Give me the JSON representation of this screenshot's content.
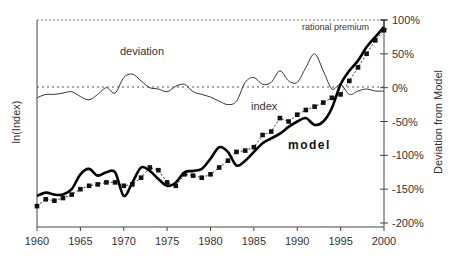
{
  "chart_data": {
    "type": "line",
    "title": "",
    "xlabel": "",
    "ylabel_left": "ln(Index)",
    "ylabel_right": "Deviation from Model",
    "xlim": [
      1960,
      2000
    ],
    "x_ticks": [
      "1960",
      "1965",
      "1970",
      "1975",
      "1980",
      "1985",
      "1990",
      "1995",
      "2000"
    ],
    "right_axis_ticks": [
      "100%",
      "50%",
      "0%",
      "-50%",
      "-100%",
      "-150%",
      "-200%"
    ],
    "right_axis_range": [
      -200,
      100
    ],
    "grid": false,
    "zero_line": "dotted",
    "top_line": "dotted",
    "annotations": {
      "deviation": "deviation",
      "index": "index",
      "model": "model",
      "rational_premium": "rational premium"
    },
    "series": [
      {
        "name": "deviation",
        "style": "thin solid line",
        "axis": "right",
        "x": [
          1960,
          1961,
          1962,
          1963,
          1964,
          1965,
          1966,
          1967,
          1968,
          1969,
          1970,
          1971,
          1972,
          1973,
          1974,
          1975,
          1976,
          1977,
          1978,
          1979,
          1980,
          1981,
          1982,
          1983,
          1984,
          1985,
          1986,
          1987,
          1988,
          1989,
          1990,
          1991,
          1992,
          1993,
          1994,
          1995,
          1996,
          1997,
          1998,
          1999,
          2000
        ],
        "values": [
          -15,
          -10,
          -10,
          -8,
          -6,
          -13,
          -18,
          -10,
          0,
          -8,
          15,
          20,
          10,
          0,
          -2,
          -6,
          2,
          5,
          -6,
          -10,
          -14,
          -20,
          -25,
          -20,
          8,
          15,
          5,
          8,
          25,
          10,
          8,
          30,
          50,
          25,
          -2,
          5,
          -10,
          -5,
          -2,
          -5,
          -5
        ]
      },
      {
        "name": "index",
        "style": "dashed line with square markers",
        "axis": "left",
        "x": [
          1960,
          1961,
          1962,
          1963,
          1964,
          1965,
          1966,
          1967,
          1968,
          1969,
          1970,
          1971,
          1972,
          1973,
          1974,
          1975,
          1976,
          1977,
          1978,
          1979,
          1980,
          1981,
          1982,
          1983,
          1984,
          1985,
          1986,
          1987,
          1988,
          1989,
          1990,
          1991,
          1992,
          1993,
          1994,
          1995,
          1996,
          1997,
          1998,
          1999,
          2000
        ],
        "values": [
          -175,
          -165,
          -167,
          -163,
          -158,
          -150,
          -145,
          -143,
          -140,
          -140,
          -145,
          -143,
          -133,
          -118,
          -122,
          -140,
          -145,
          -128,
          -130,
          -133,
          -128,
          -118,
          -108,
          -95,
          -93,
          -88,
          -70,
          -65,
          -45,
          -50,
          -40,
          -33,
          -28,
          -22,
          -15,
          -10,
          10,
          30,
          50,
          70,
          85
        ]
      },
      {
        "name": "model",
        "style": "thick solid line",
        "axis": "left",
        "x": [
          1960,
          1961,
          1962,
          1963,
          1964,
          1965,
          1966,
          1967,
          1968,
          1969,
          1970,
          1971,
          1972,
          1973,
          1974,
          1975,
          1976,
          1977,
          1978,
          1979,
          1980,
          1981,
          1982,
          1983,
          1984,
          1985,
          1986,
          1987,
          1988,
          1989,
          1990,
          1991,
          1992,
          1993,
          1994,
          1995,
          1996,
          1997,
          1998,
          1999,
          2000
        ],
        "values": [
          -160,
          -155,
          -158,
          -158,
          -150,
          -128,
          -120,
          -130,
          -125,
          -125,
          -160,
          -140,
          -118,
          -123,
          -135,
          -145,
          -140,
          -125,
          -123,
          -120,
          -105,
          -88,
          -95,
          -115,
          -108,
          -95,
          -82,
          -75,
          -68,
          -58,
          -50,
          -45,
          -55,
          -50,
          -30,
          5,
          25,
          40,
          60,
          75,
          90
        ]
      }
    ]
  }
}
